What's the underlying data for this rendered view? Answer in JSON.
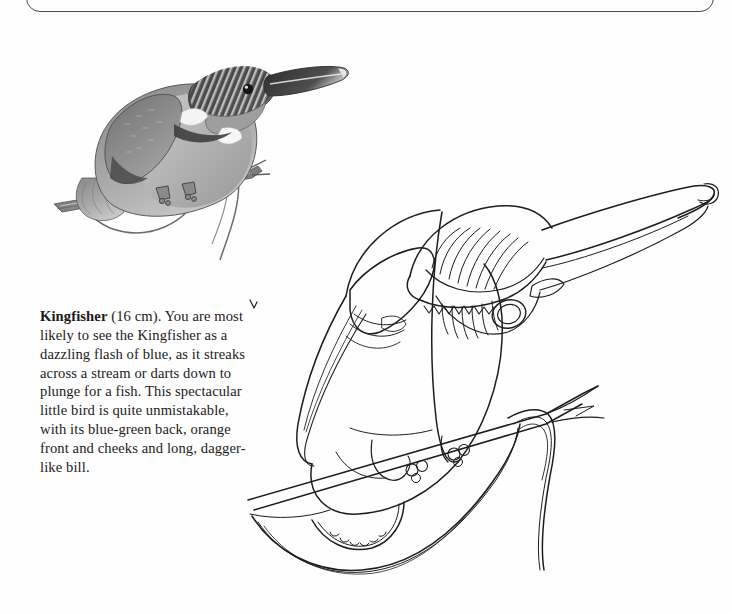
{
  "page": {
    "background_color": "#fefefe",
    "ink_color": "#1b1b1b",
    "frame_color": "#4a4a4a",
    "width": 732,
    "height": 614
  },
  "frame": {
    "name": "rounded-panel-bottom-edge",
    "description": "bottom rounded edge of a panel continuing above the crop"
  },
  "caption": {
    "species": "Kingfisher",
    "size": " (16 cm). ",
    "body": "You are most likely to see the Kingfisher as a dazzling flash of blue, as it streaks across a stream or darts down to plunge for a fish. This spectacular little bird is quite unmistakable, with its blue-green back, orange front and cheeks and long, dagger-like bill."
  },
  "figures": [
    {
      "id": "photo-fig",
      "name": "kingfisher-shaded-illustration",
      "style": "grayscale stippled/hatched tonal drawing",
      "subject": "Kingfisher perched on a diagonal reed stem, facing right, long dagger bill, barred crown, white neck patch, pale breast"
    },
    {
      "id": "line-fig",
      "name": "kingfisher-line-drawing",
      "style": "black outline contour drawing, no shading",
      "subject": "Kingfisher perched on a diagonal branch, facing right, hatched crown and cheek feathering, large eye ring, long straight bill, hanging reed below"
    }
  ]
}
